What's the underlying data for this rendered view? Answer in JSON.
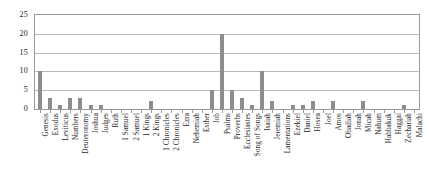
{
  "chart_data": {
    "type": "bar",
    "title": "",
    "subtitle": "",
    "xlabel": "",
    "ylabel": "",
    "ylim": [
      0,
      25
    ],
    "yticks": [
      0,
      5,
      10,
      15,
      20,
      25
    ],
    "grid": true,
    "legend": null,
    "bar_color": "#8d8d8d",
    "axis_color": "#9a9a9a",
    "grid_color": "#b9b9b9",
    "categories": [
      "Genesis",
      "Exodus",
      "Leviticus",
      "Numbers",
      "Deuteronomy",
      "Joshua",
      "Judges",
      "Ruth",
      "1 Samuel",
      "2 Samuel",
      "1 Kings",
      "2 Kings",
      "1 Chronicles",
      "2 Chronicles",
      "Ezra",
      "Nehemiah",
      "Esther",
      "Job",
      "Psalms",
      "Proverbs",
      "Ecclesiastes",
      "Song of Songs",
      "Isaiah",
      "Jeremiah",
      "Lamentations",
      "Ezekiel",
      "Daniel",
      "Hosea",
      "Joel",
      "Amos",
      "Obadiah",
      "Jonah",
      "Micah",
      "Nahum",
      "Habbakuk",
      "Haggai",
      "Zechariah",
      "Malachi"
    ],
    "values": [
      10,
      3,
      1,
      3,
      3,
      1,
      1,
      0,
      0,
      0,
      0,
      2,
      0,
      0,
      0,
      0,
      0,
      5,
      20,
      5,
      3,
      1,
      10,
      2,
      0,
      1,
      1,
      2,
      0,
      2,
      0,
      0,
      2,
      0,
      0,
      0,
      1,
      0
    ]
  }
}
